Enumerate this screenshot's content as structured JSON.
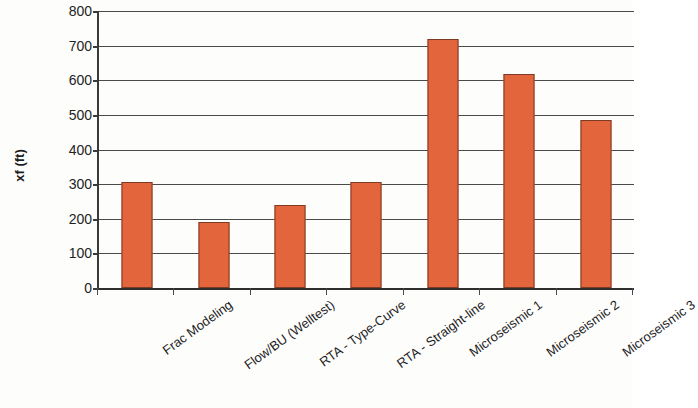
{
  "chart_data": {
    "type": "bar",
    "title": "",
    "xlabel": "",
    "ylabel": "xf (ft)",
    "ylim": [
      0,
      800
    ],
    "ytick_labels": [
      "800",
      "700",
      "600",
      "500",
      "400",
      "300",
      "200",
      "100",
      "0"
    ],
    "yticks": [
      800,
      700,
      600,
      500,
      400,
      300,
      200,
      100,
      0
    ],
    "grid": true,
    "legend": "none",
    "bar_color": "#e2653c",
    "bar_edge_color": "#7d3a24",
    "categories": [
      "Frac Modeling",
      "Flow/BU (Welltest)",
      "RTA - Type-Curve",
      "RTA - Straight-line",
      "Microseismic 1",
      "Microseismic 2",
      "Microseismic 3"
    ],
    "values": [
      305,
      190,
      240,
      305,
      720,
      618,
      485
    ]
  }
}
